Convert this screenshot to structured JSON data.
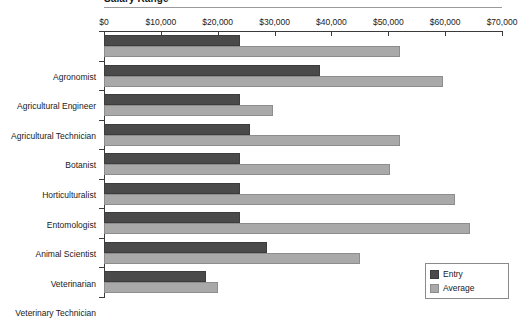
{
  "chart_data": {
    "type": "bar",
    "orientation": "horizontal",
    "title": "Salary Range",
    "xlabel": "",
    "ylabel": "",
    "xlim": [
      0,
      70000
    ],
    "grid": false,
    "legend_position": "bottom-right",
    "tick_labels": [
      "$0",
      "$10,000",
      "$20,000",
      "$30,000",
      "$40,000",
      "$50,000",
      "$60,000",
      "$70,000"
    ],
    "tick_values": [
      0,
      10000,
      20000,
      30000,
      40000,
      50000,
      60000,
      70000
    ],
    "categories": [
      "Agronomist",
      "Agricultural Engineer",
      "Agricultural Technician",
      "Botanist",
      "Horticulturalist",
      "Entomologist",
      "Animal Scientist",
      "Veterinarian",
      "Veterinary Technician"
    ],
    "series": [
      {
        "name": "Entry",
        "color": "#4a4a4a",
        "values": [
          24000,
          38000,
          24000,
          25700,
          24000,
          24000,
          24000,
          28700,
          18000
        ]
      },
      {
        "name": "Average",
        "color": "#a9a9a9",
        "values": [
          52000,
          59600,
          29700,
          52000,
          50300,
          61700,
          64400,
          45000,
          20000
        ]
      }
    ]
  },
  "legend": {
    "items": [
      {
        "label": "Entry"
      },
      {
        "label": "Average"
      }
    ]
  }
}
